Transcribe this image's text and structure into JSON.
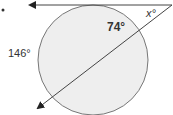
{
  "diagram": {
    "type": "circle-tangent-secant",
    "labels": {
      "angle_x": "x°",
      "arc_74": "74°",
      "arc_146": "146°"
    },
    "colors": {
      "circle_fill": "#eeeeee",
      "circle_stroke": "#777777",
      "line": "#444444",
      "text": "#333333"
    }
  }
}
